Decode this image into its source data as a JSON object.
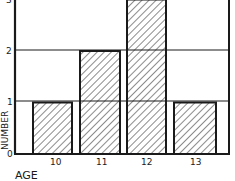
{
  "chart_data": {
    "type": "bar",
    "title": "",
    "xlabel": "AGE",
    "ylabel": "NUMBER",
    "categories": [
      "10",
      "11",
      "12",
      "13"
    ],
    "values": [
      1,
      2,
      3,
      1
    ],
    "ylim": [
      0,
      3
    ],
    "yticks": [
      "0",
      "1",
      "2",
      "3"
    ],
    "grid": true,
    "legend": null,
    "style": "hand-drawn, diagonal hatched bars"
  },
  "colors": {
    "ink": "#1a1a1a",
    "background": "#ffffff"
  }
}
